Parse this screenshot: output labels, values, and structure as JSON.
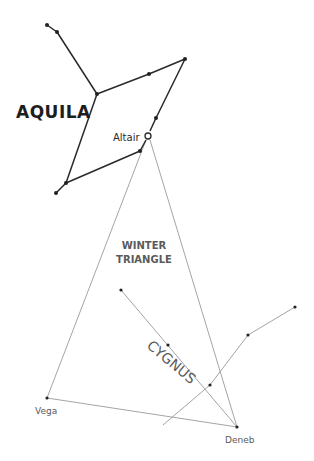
{
  "diagram": {
    "colors": {
      "background": "#ffffff",
      "aquila_line": "#2a2a2a",
      "thin_line": "#9a9a9a",
      "label_dark": "#1e1e1e",
      "label_gray": "#5a5a5a",
      "star": "#222222"
    },
    "labels": {
      "aquila": "AQUILA",
      "altair": "Altair",
      "winter_line1": "WINTER",
      "winter_line2": "TRIANGLE",
      "cygnus": "CYGNUS",
      "vega": "Vega",
      "deneb": "Deneb"
    },
    "aquila": {
      "stars": [
        {
          "x": 47,
          "y": 25
        },
        {
          "x": 57,
          "y": 32
        },
        {
          "x": 97,
          "y": 94
        },
        {
          "x": 149,
          "y": 74
        },
        {
          "x": 185,
          "y": 59
        },
        {
          "x": 156,
          "y": 118
        },
        {
          "x": 140,
          "y": 151
        },
        {
          "x": 66,
          "y": 183
        },
        {
          "x": 56,
          "y": 193
        }
      ],
      "altair": {
        "x": 148,
        "y": 136
      }
    },
    "triangle": {
      "altair": {
        "x": 148,
        "y": 136
      },
      "vega": {
        "x": 47,
        "y": 398
      },
      "deneb": {
        "x": 237,
        "y": 427
      }
    },
    "cygnus": {
      "body_stars": [
        {
          "x": 121,
          "y": 290
        },
        {
          "x": 168,
          "y": 345
        },
        {
          "x": 210,
          "y": 385
        }
      ],
      "wing_stars": [
        {
          "x": 248,
          "y": 335
        },
        {
          "x": 295,
          "y": 307
        }
      ]
    }
  }
}
